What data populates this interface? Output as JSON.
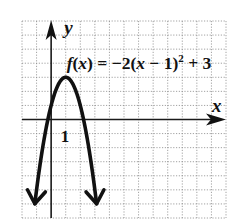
{
  "chart_data": {
    "type": "line",
    "title": "",
    "function_label": {
      "prefix_italic": "f",
      "open": "(",
      "var": "x",
      "middle": ") = −2(",
      "var2": "x",
      "tail": " − 1)",
      "exp": "2",
      "end": " + 3"
    },
    "function": {
      "form": "vertex",
      "a": -2,
      "h": 1,
      "k": 3
    },
    "vertex": [
      1,
      3
    ],
    "x_intercepts": [
      -0.22,
      2.22
    ],
    "xlabel": "x",
    "ylabel": "y",
    "xlim": [
      -2,
      12
    ],
    "ylim": [
      -7,
      7
    ],
    "grid": true,
    "grid_step": 1,
    "tick_labels": [
      {
        "axis": "x",
        "value": 1,
        "text": "1"
      }
    ],
    "curve_extent": {
      "x_min": -1.12,
      "x_max": 3.12
    },
    "arrows": [
      "curve-left-down",
      "curve-right-down",
      "x-axis-positive",
      "y-axis-positive"
    ]
  }
}
